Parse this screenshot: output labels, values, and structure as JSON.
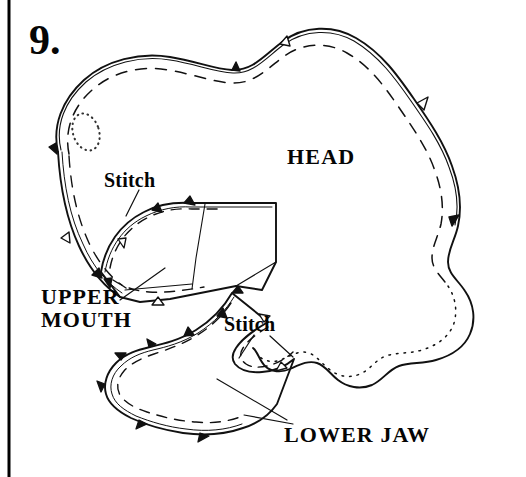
{
  "page": {
    "width": 526,
    "height": 477,
    "background_color": "#ffffff",
    "ink_color": "#000000",
    "border": {
      "side": "left",
      "color": "#000000",
      "width_px": 3
    }
  },
  "step": {
    "number_label": "9."
  },
  "labels": {
    "head": "HEAD",
    "stitch_upper": "Stitch",
    "stitch_lower": "Stitch",
    "upper_mouth": "UPPER\nMOUTH",
    "lower_jaw": "LOWER JAW"
  },
  "figure": {
    "pieces": [
      {
        "name": "head",
        "label": "HEAD",
        "outline": "closed irregular blob, double-drawn cut line; upper-left through top rounded, right side descending, bottom and lower-right scalloped/wavy",
        "seam_line_style": "dashed on upper and left edges, dotted on lower-right scalloped edge",
        "notches": 6,
        "marking": "small dotted oval (eye placement) in upper-left interior"
      },
      {
        "name": "upper-mouth",
        "label": "UPPER MOUTH",
        "outline": "curved wedge panel, double-drawn cut line with straight right flap",
        "seam_line_style": "dashed",
        "notches": 5
      },
      {
        "name": "lower-jaw",
        "label": "LOWER JAW",
        "outline": "crescent / boomerang band, double-drawn cut line",
        "seam_line_style": "dashed",
        "notches": 9
      }
    ],
    "leader_lines": [
      {
        "from": "stitch_upper",
        "to": "head upper mouth seam"
      },
      {
        "from": "stitch_lower",
        "to": "lower jaw seam"
      },
      {
        "from": "upper_mouth",
        "to": "upper mouth piece"
      },
      {
        "from": "lower_jaw",
        "to": "lower jaw piece"
      }
    ]
  }
}
